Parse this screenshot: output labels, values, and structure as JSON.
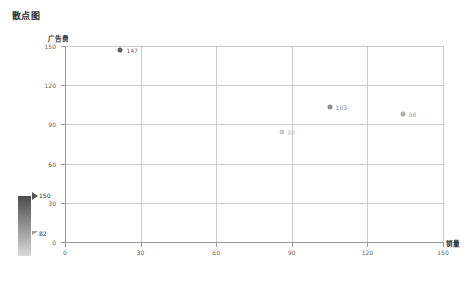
{
  "chart_data": {
    "type": "scatter",
    "title": "散点图",
    "xlabel": "销量",
    "ylabel": "广告费",
    "xlim": [
      0,
      150
    ],
    "ylim": [
      0,
      150
    ],
    "xticks": [
      "0",
      "30",
      "60",
      "90",
      "120",
      "150"
    ],
    "yticks": [
      "0",
      "30",
      "60",
      "90",
      "120",
      "150"
    ],
    "grid": true,
    "legend_position": "none",
    "points": [
      {
        "x": 22,
        "y": 147,
        "label": "147",
        "color": "#5c5c5c",
        "label_color": "#666666"
      },
      {
        "x": 105,
        "y": 103,
        "label": "103",
        "color": "#8e8e8e",
        "label_color": "#888888"
      },
      {
        "x": 134,
        "y": 98,
        "label": "98",
        "color": "#b0b0b0",
        "label_color": "#a6a6a6"
      },
      {
        "x": 86,
        "y": 84,
        "label": "84",
        "color": "#cccccc",
        "label_color": "#c4c4c4"
      }
    ],
    "visual_map": {
      "name": "visual-map",
      "max_label": "150",
      "min_label": "82",
      "gradient_high": "#4c4c4c",
      "gradient_low": "#d9d9d9"
    }
  }
}
